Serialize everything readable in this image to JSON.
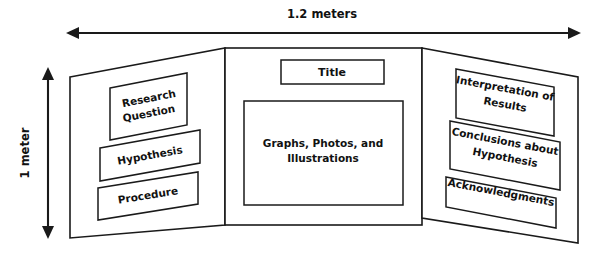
{
  "diagram": {
    "stroke_color": "#1a1a1a",
    "text_color": "#111111",
    "background_color": "#ffffff"
  },
  "dimensions": {
    "width_label": "1.2 meters",
    "height_label": "1 meter"
  },
  "panels": {
    "left": {
      "name": "left-panel",
      "boxes": [
        {
          "id": "research-question",
          "lines": [
            "Research",
            "Question"
          ]
        },
        {
          "id": "hypothesis",
          "lines": [
            "Hypothesis"
          ]
        },
        {
          "id": "procedure",
          "lines": [
            "Procedure"
          ]
        }
      ]
    },
    "center": {
      "name": "center-panel",
      "boxes": [
        {
          "id": "title",
          "lines": [
            "Title"
          ]
        },
        {
          "id": "graphs-photos-illustrations",
          "lines": [
            "Graphs, Photos, and",
            "Illustrations"
          ]
        }
      ]
    },
    "right": {
      "name": "right-panel",
      "boxes": [
        {
          "id": "interpretation-of-results",
          "lines": [
            "Interpretation of",
            "Results"
          ]
        },
        {
          "id": "conclusions-about-hypothesis",
          "lines": [
            "Conclusions about",
            "Hypothesis"
          ]
        },
        {
          "id": "acknowledgments",
          "lines": [
            "Acknowledgments"
          ]
        }
      ]
    }
  }
}
